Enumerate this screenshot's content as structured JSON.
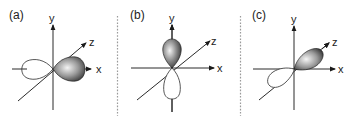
{
  "figure": {
    "panels": [
      {
        "id": "a",
        "label": "(a)",
        "orbital": "px",
        "axes": {
          "x": "x",
          "y": "y",
          "z": "z"
        },
        "shaded_lobe_direction": "+x",
        "unshaded_lobe_direction": "-x"
      },
      {
        "id": "b",
        "label": "(b)",
        "orbital": "py",
        "axes": {
          "x": "x",
          "y": "y",
          "z": "z"
        },
        "shaded_lobe_direction": "+y",
        "unshaded_lobe_direction": "-y"
      },
      {
        "id": "c",
        "label": "(c)",
        "orbital": "pz",
        "axes": {
          "x": "x",
          "y": "y",
          "z": "z"
        },
        "shaded_lobe_direction": "+z",
        "unshaded_lobe_direction": "-z"
      }
    ],
    "colors": {
      "axis": "#2a2a2a",
      "shaded_lobe_dark": "#1a1a1a",
      "shaded_lobe_light": "#f2f2f2",
      "unshaded_lobe_stroke": "#444444",
      "divider": "#9a9a9a"
    }
  }
}
